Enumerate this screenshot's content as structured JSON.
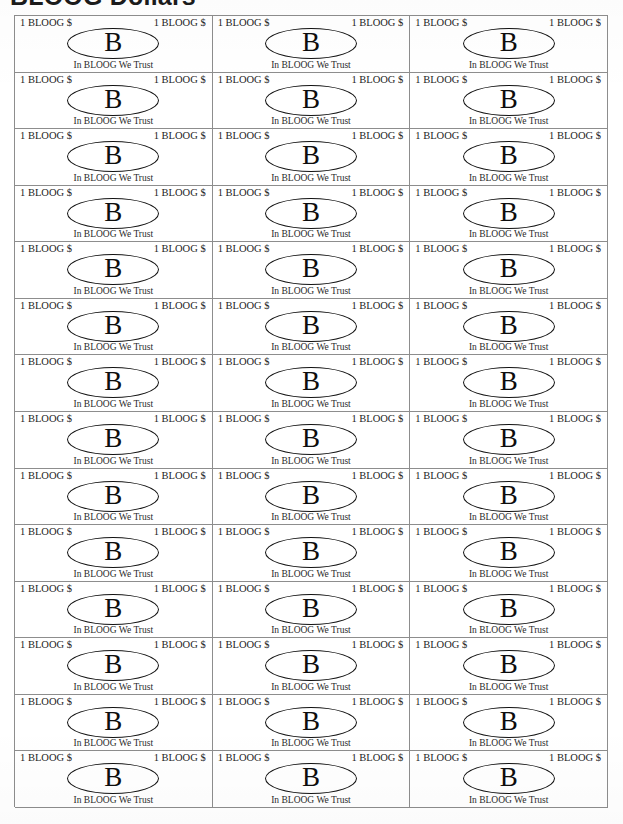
{
  "page": {
    "title": "BLOOG Dollars",
    "document_type": "printable play-money sheet"
  },
  "sheet": {
    "columns": 3,
    "rows": 14,
    "total_bills": 42
  },
  "bill": {
    "denomination_left": "1 BLOOG $",
    "denomination_right": "1 BLOOG $",
    "seal_letter": "B",
    "motto": "In BLOOG We Trust"
  },
  "colors": {
    "ink": "#121212",
    "rule": "#8d8d8d",
    "paper": "#ffffff"
  }
}
